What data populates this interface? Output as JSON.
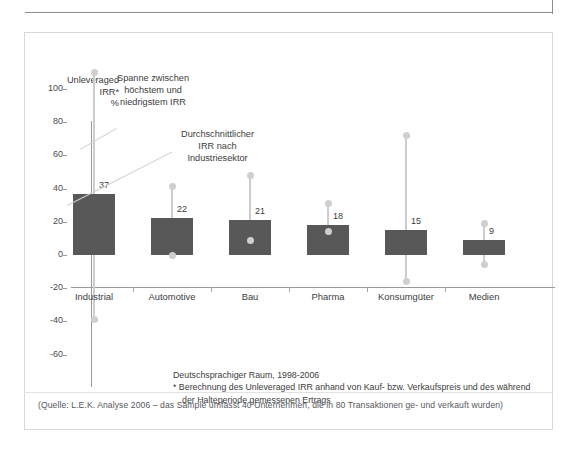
{
  "axis": {
    "y_title_lines": [
      "Unleveraged",
      "IRR*",
      "%"
    ],
    "y_ticks": [
      100,
      80,
      60,
      40,
      20,
      0,
      -20,
      -40,
      -60
    ]
  },
  "callouts": {
    "range": [
      "Spanne zwischen",
      "höchstem und",
      "niedrigstem IRR"
    ],
    "average": [
      "Durchschnittlicher",
      "IRR nach",
      "Industriesektor"
    ]
  },
  "footnote": {
    "line1": "Deutschsprachiger Raum, 1998-2006",
    "line2": "* Berechnung des Unleveraged IRR anhand von Kauf- bzw. Verkaufspreis und des während",
    "line3": "der Halteperiode gemessenen Ertrags"
  },
  "source": "(Quelle: L.E.K. Analyse 2006 – das Sample umfasst 40 Unternehmen, die in 80 Transaktionen ge- und verkauft wurden)",
  "colors": {
    "bar": "#585858",
    "whisker": "#cfcfcf",
    "axis": "#9a9a9a",
    "text": "#3c3c3c",
    "panel_border": "#d8d8d8"
  },
  "chart_data": {
    "type": "bar",
    "title": "",
    "xlabel": "",
    "ylabel": "Unleveraged IRR* %",
    "ylim": [
      -60,
      100
    ],
    "yticks": [
      -60,
      -40,
      -20,
      0,
      20,
      40,
      60,
      80,
      100
    ],
    "grid": false,
    "legend": "none",
    "categories": [
      "Industrial",
      "Automotive",
      "Bau",
      "Pharma",
      "Konsumgüter",
      "Medien"
    ],
    "values": [
      37,
      22,
      21,
      18,
      15,
      9
    ],
    "value_labels": [
      "37",
      "22",
      "21",
      "18",
      "15",
      "9"
    ],
    "series": [
      {
        "name": "Durchschnittlicher IRR nach Industriesektor",
        "values": [
          37,
          22,
          21,
          18,
          15,
          9
        ]
      },
      {
        "name": "Höchster IRR",
        "values": [
          110,
          41,
          48,
          31,
          72,
          19
        ]
      },
      {
        "name": "Niedrigster IRR",
        "values": [
          -39,
          0,
          9,
          14,
          -16,
          -6
        ]
      }
    ],
    "ranges": [
      {
        "category": "Industrial",
        "mean": 37,
        "max": 110,
        "min": -39
      },
      {
        "category": "Automotive",
        "mean": 22,
        "max": 41,
        "min": 0
      },
      {
        "category": "Bau",
        "mean": 21,
        "max": 48,
        "min": 9
      },
      {
        "category": "Pharma",
        "mean": 18,
        "max": 31,
        "min": 14
      },
      {
        "category": "Konsumgüter",
        "mean": 15,
        "max": 72,
        "min": -16
      },
      {
        "category": "Medien",
        "mean": 9,
        "max": 19,
        "min": -6
      }
    ]
  }
}
